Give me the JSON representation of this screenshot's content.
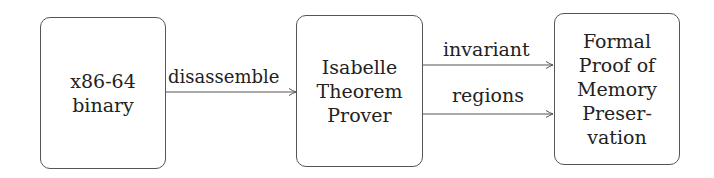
{
  "nodes": [
    {
      "id": "binary",
      "lines": [
        "x86-64",
        "binary"
      ]
    },
    {
      "id": "isabelle",
      "lines": [
        "Isabelle",
        "Theorem",
        "Prover"
      ]
    },
    {
      "id": "proof",
      "lines": [
        "Formal",
        "Proof of",
        "Memory",
        "Preser-",
        "vation"
      ]
    }
  ],
  "edges": [
    {
      "from": "binary",
      "to": "isabelle",
      "label": "disassemble"
    },
    {
      "from": "isabelle",
      "to": "proof",
      "label": "invariant"
    },
    {
      "from": "isabelle",
      "to": "proof",
      "label": "regions"
    }
  ],
  "colors": {
    "stroke": "#555555",
    "text": "#222222",
    "background": "#ffffff"
  }
}
